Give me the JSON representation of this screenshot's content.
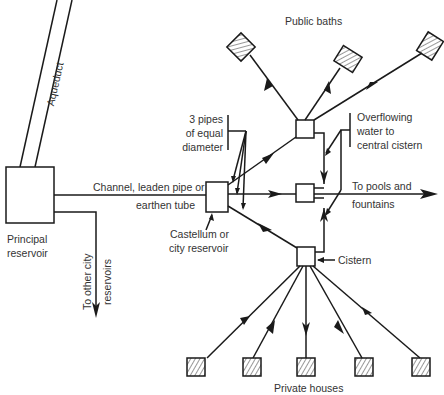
{
  "diagram": {
    "colors": {
      "line": "#1a1a1a",
      "text": "#333333",
      "background": "#ffffff"
    },
    "labels": {
      "aqueduct": "Aqueduct",
      "principal_reservoir_1": "Principal",
      "principal_reservoir_2": "reservoir",
      "channel_1": "Channel, leaden pipe or",
      "channel_2": "earthen tube",
      "other_city_1": "To other city",
      "other_city_2": "reservoirs",
      "castellum_1": "Castellum or",
      "castellum_2": "city reservoir",
      "three_pipes_1": "3 pipes",
      "three_pipes_2": "of equal",
      "three_pipes_3": "diameter",
      "public_baths": "Public baths",
      "overflow_1": "Overflowing",
      "overflow_2": "water to",
      "overflow_3": "central cistern",
      "pools_1": "To pools and",
      "pools_2": "fountains",
      "cistern": "Cistern",
      "private_houses": "Private houses"
    },
    "nodes": [
      "Principal reservoir",
      "Castellum or city reservoir",
      "Upper cistern (public baths)",
      "Central cistern (pools and fountains)",
      "Lower cistern (private houses)",
      "Public bath 1",
      "Public bath 2",
      "Public bath 3",
      "Private house 1",
      "Private house 2",
      "Private house 3",
      "Private house 4",
      "Private house 5"
    ]
  }
}
